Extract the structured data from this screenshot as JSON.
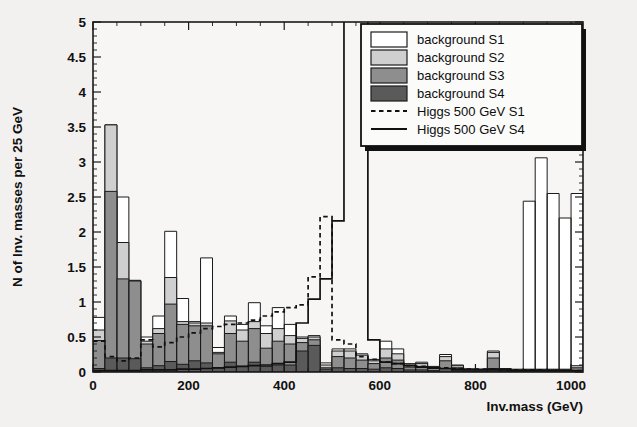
{
  "chart_data": {
    "type": "bar",
    "subtype": "stacked-histogram-with-overlay-lines",
    "title": "",
    "xlabel": "Inv.mass (GeV)",
    "ylabel": "N of Inv. masses per 25 GeV",
    "xlim": [
      0,
      1025
    ],
    "ylim": [
      0,
      5
    ],
    "bin_width": 25,
    "x_ticks": [
      0,
      200,
      400,
      600,
      800,
      1000
    ],
    "x_tick_labels": [
      "0",
      "200",
      "400",
      "600",
      "800",
      "1000"
    ],
    "x_minor_tick_step": 50,
    "y_ticks": [
      0,
      0.5,
      1,
      1.5,
      2,
      2.5,
      3,
      3.5,
      4,
      4.5,
      5
    ],
    "y_tick_labels": [
      "0",
      "0.5",
      "1",
      "1.5",
      "2",
      "2.5",
      "3",
      "3.5",
      "4",
      "4.5",
      "5"
    ],
    "y_minor_tick_step": 0.1,
    "grid": false,
    "bin_left_edges": [
      0,
      25,
      50,
      75,
      100,
      125,
      150,
      175,
      200,
      225,
      250,
      275,
      300,
      325,
      350,
      375,
      400,
      425,
      450,
      475,
      500,
      525,
      550,
      575,
      600,
      625,
      650,
      675,
      700,
      725,
      750,
      775,
      800,
      825,
      850,
      875,
      900,
      925,
      950,
      975,
      1000
    ],
    "series": [
      {
        "name": "background S1",
        "color": "#ffffff",
        "stack_order": 4,
        "note": "outermost (total) stacked level, drawn white with black outline",
        "values": [
          0.78,
          3.53,
          2.5,
          1.31,
          0.5,
          0.8,
          2.01,
          1.05,
          0.72,
          1.63,
          0.35,
          0.8,
          0.68,
          0.99,
          0.66,
          0.92,
          0.68,
          0.5,
          0.52,
          0.13,
          0.33,
          0.33,
          0.26,
          0.18,
          0.44,
          0.33,
          0.12,
          0.14,
          0.08,
          0.25,
          0.1,
          0.03,
          0.04,
          0.3,
          0.05,
          0.04,
          2.44,
          3.06,
          2.55,
          2.2,
          2.55
        ]
      },
      {
        "name": "background S2",
        "color": "#cfcfcf",
        "stack_order": 3,
        "values": [
          0.6,
          3.53,
          1.85,
          1.3,
          0.44,
          0.62,
          1.35,
          0.72,
          0.7,
          0.7,
          0.28,
          0.73,
          0.6,
          0.72,
          0.55,
          0.62,
          0.52,
          0.48,
          0.5,
          0.1,
          0.3,
          0.3,
          0.24,
          0.16,
          0.33,
          0.26,
          0.1,
          0.12,
          0.07,
          0.22,
          0.09,
          0.03,
          0.04,
          0.28,
          0.04,
          0.03,
          0.04,
          0.04,
          0.04,
          0.04,
          0.09
        ]
      },
      {
        "name": "background S3",
        "color": "#8e8e8e",
        "stack_order": 2,
        "values": [
          0.45,
          2.58,
          1.33,
          1.3,
          0.4,
          0.55,
          0.97,
          0.68,
          0.66,
          0.66,
          0.26,
          0.55,
          0.44,
          0.62,
          0.34,
          0.44,
          0.4,
          0.42,
          0.46,
          0.06,
          0.22,
          0.2,
          0.17,
          0.12,
          0.2,
          0.17,
          0.07,
          0.08,
          0.05,
          0.16,
          0.06,
          0.02,
          0.03,
          0.2,
          0.03,
          0.02,
          0.03,
          0.03,
          0.03,
          0.03,
          0.06
        ]
      },
      {
        "name": "background S4",
        "color": "#5a5a5a",
        "stack_order": 1,
        "note": "innermost darkest stacked level",
        "values": [
          0.05,
          0.2,
          0.2,
          0.19,
          0.06,
          0.09,
          0.15,
          0.11,
          0.16,
          0.13,
          0.06,
          0.14,
          0.08,
          0.14,
          0.08,
          0.1,
          0.1,
          0.3,
          0.38,
          0.04,
          0.06,
          0.05,
          0.05,
          0.04,
          0.06,
          0.05,
          0.03,
          0.03,
          0.02,
          0.05,
          0.02,
          0.01,
          0.01,
          0.05,
          0.01,
          0.01,
          0.01,
          0.01,
          0.01,
          0.01,
          0.02
        ]
      }
    ],
    "overlay_lines": [
      {
        "name": "Higgs 500 GeV S1",
        "style": "dashed",
        "color": "#111111",
        "values": [
          0.44,
          0.22,
          0.16,
          0.2,
          0.46,
          0.36,
          0.42,
          0.5,
          0.56,
          0.62,
          0.65,
          0.68,
          0.7,
          0.74,
          0.8,
          0.86,
          0.92,
          0.96,
          1.36,
          2.22,
          0.46,
          0.4,
          0.22,
          0.18,
          0.14,
          0.12,
          0.09,
          0.08,
          0.06,
          0.06,
          0.05,
          0.04,
          0.04,
          0.04,
          0.03,
          0.03,
          0.03,
          0.03,
          0.02,
          0.02,
          0.02
        ]
      },
      {
        "name": "Higgs 500 GeV S4",
        "style": "solid",
        "color": "#111111",
        "note": "narrow resonance peak at ~500 GeV; goes off scale above y=5",
        "values": [
          0.02,
          0.02,
          0.02,
          0.02,
          0.03,
          0.03,
          0.03,
          0.04,
          0.04,
          0.05,
          0.06,
          0.07,
          0.08,
          0.09,
          0.1,
          0.12,
          0.14,
          0.7,
          1.04,
          1.33,
          2.16,
          5.9,
          5.9,
          0.46,
          0.14,
          0.12,
          0.09,
          0.07,
          0.06,
          0.05,
          0.04,
          0.04,
          0.03,
          0.03,
          0.03,
          0.02,
          0.02,
          0.02,
          0.02,
          0.02,
          0.02
        ]
      }
    ],
    "legend": {
      "position": "top-right",
      "entries": [
        {
          "label": "background S1",
          "marker": "swatch",
          "color": "#ffffff"
        },
        {
          "label": "background S2",
          "marker": "swatch",
          "color": "#cfcfcf"
        },
        {
          "label": "background S3",
          "marker": "swatch",
          "color": "#8e8e8e"
        },
        {
          "label": "background S4",
          "marker": "swatch",
          "color": "#5a5a5a"
        },
        {
          "label": "Higgs 500 GeV S1",
          "marker": "dashed-line",
          "color": "#111111"
        },
        {
          "label": "Higgs 500 GeV S4",
          "marker": "solid-line",
          "color": "#111111"
        }
      ]
    }
  }
}
